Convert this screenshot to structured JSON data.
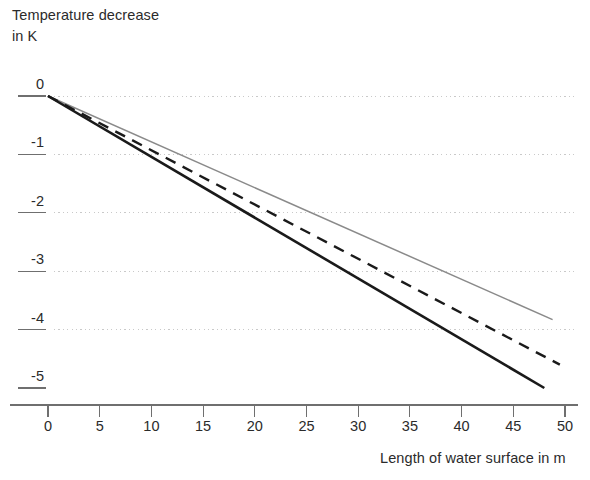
{
  "chart_data": {
    "type": "line",
    "title": "",
    "ylabel": "Temperature decrease\nin K",
    "ylabel_line1": "Temperature decrease",
    "ylabel_line2": "in K",
    "xlabel": "Length of water surface in m",
    "xlim": [
      0,
      50
    ],
    "ylim": [
      -5,
      0
    ],
    "xticks": [
      0,
      5,
      10,
      15,
      20,
      25,
      30,
      35,
      40,
      45,
      50
    ],
    "xtick_labels": [
      "0",
      "5",
      "10",
      "15",
      "20",
      "25",
      "30",
      "35",
      "40",
      "45",
      "50"
    ],
    "yticks": [
      0,
      -1,
      -2,
      -3,
      -4,
      -5
    ],
    "ytick_labels": [
      "0",
      "-1",
      "-2",
      "-3",
      "-4",
      "-5"
    ],
    "grid": "horizontal-dotted",
    "gridlines_at": [
      0,
      -1,
      -2,
      -3,
      -4
    ],
    "legend": "none",
    "colors": {
      "solid_black": "#1a1a1a",
      "dashed_black": "#1a1a1a",
      "solid_gray": "#8a8a8a",
      "gridline": "#c9c9c9",
      "axis": "#6f6f6f",
      "text": "#2b2b2b"
    },
    "series": [
      {
        "name": "steepest-decrease",
        "style": "solid",
        "color": "#1a1a1a",
        "width": 2.6,
        "x": [
          0,
          48
        ],
        "values": [
          0,
          -5.0
        ]
      },
      {
        "name": "medium-decrease",
        "style": "dashed",
        "color": "#1a1a1a",
        "width": 2.4,
        "x": [
          0,
          49.5
        ],
        "values": [
          0,
          -4.6
        ]
      },
      {
        "name": "shallowest-decrease",
        "style": "solid",
        "color": "#8a8a8a",
        "width": 1.5,
        "x": [
          0,
          48.8
        ],
        "values": [
          0,
          -3.83
        ]
      }
    ]
  }
}
